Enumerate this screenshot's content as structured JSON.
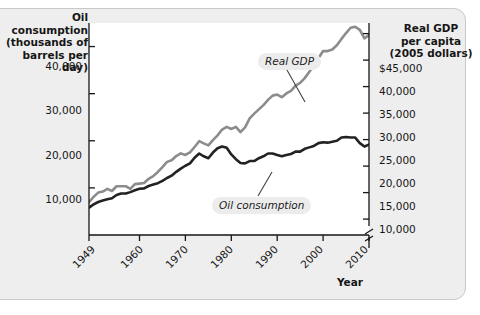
{
  "chart_data": {
    "type": "line",
    "title": "",
    "xlabel": "Year",
    "grid": false,
    "legend_position": "inline-callouts",
    "x": [
      1949,
      1950,
      1951,
      1952,
      1953,
      1954,
      1955,
      1956,
      1957,
      1958,
      1959,
      1960,
      1961,
      1962,
      1963,
      1964,
      1965,
      1966,
      1967,
      1968,
      1969,
      1970,
      1971,
      1972,
      1973,
      1974,
      1975,
      1976,
      1977,
      1978,
      1979,
      1980,
      1981,
      1982,
      1983,
      1984,
      1985,
      1986,
      1987,
      1988,
      1989,
      1990,
      1991,
      1992,
      1993,
      1994,
      1995,
      1996,
      1997,
      1998,
      1999,
      2000,
      2001,
      2002,
      2003,
      2004,
      2005,
      2006,
      2007,
      2008,
      2009,
      2010
    ],
    "xticks": [
      "1949",
      "1960",
      "1970",
      "1980",
      "1990",
      "2000",
      "2010"
    ],
    "xtick_values": [
      1949,
      1960,
      1970,
      1980,
      1990,
      2000,
      2010
    ],
    "axes": [
      {
        "id": "left",
        "label": "Oil consumption\n(thousands of\nbarrels per day)",
        "ticks": [
          "40,000",
          "30,000",
          "20,000",
          "10,000"
        ],
        "tick_values": [
          40000,
          30000,
          20000,
          10000
        ],
        "range": [
          0,
          45000
        ],
        "broken": false
      },
      {
        "id": "right",
        "label": "Real GDP\nper capita\n(2005 dollars)",
        "ticks": [
          "$45,000",
          "40,000",
          "35,000",
          "30,000",
          "25,000",
          "20,000",
          "15,000",
          "10,000"
        ],
        "tick_values": [
          45000,
          40000,
          35000,
          30000,
          25000,
          20000,
          15000,
          10000
        ],
        "range": [
          7000,
          47000
        ],
        "broken": true
      }
    ],
    "series": [
      {
        "name": "Real GDP",
        "axis": "right",
        "color": "#8c8c8c",
        "unit": "2005 dollars per capita",
        "values": [
          13200,
          14200,
          15000,
          15200,
          15700,
          15300,
          16200,
          16200,
          16200,
          15700,
          16600,
          16700,
          16800,
          17600,
          18100,
          18900,
          19800,
          20800,
          21100,
          21900,
          22400,
          22100,
          22600,
          23600,
          24700,
          24300,
          23900,
          24900,
          25800,
          26900,
          27400,
          27000,
          27400,
          26400,
          27300,
          29000,
          29900,
          30700,
          31500,
          32500,
          33300,
          33500,
          33000,
          33700,
          34200,
          35200,
          35700,
          36600,
          37800,
          39000,
          40400,
          41700,
          41700,
          42000,
          42800,
          44000,
          45100,
          46100,
          46300,
          45700,
          44100,
          44700
        ]
      },
      {
        "name": "Oil consumption",
        "axis": "left",
        "color": "#222222",
        "unit": "thousands of barrels per day",
        "values": [
          5800,
          6500,
          7000,
          7300,
          7600,
          7800,
          8500,
          8800,
          8800,
          9100,
          9500,
          9800,
          9900,
          10400,
          10700,
          11000,
          11500,
          12100,
          12600,
          13400,
          14100,
          14700,
          15200,
          16400,
          17300,
          16700,
          16300,
          17500,
          18400,
          18800,
          18500,
          17100,
          16100,
          15300,
          15200,
          15700,
          15700,
          16300,
          16700,
          17300,
          17300,
          17000,
          16700,
          17000,
          17200,
          17700,
          17700,
          18300,
          18600,
          18900,
          19500,
          19700,
          19600,
          19800,
          20000,
          20700,
          20800,
          20700,
          20680,
          19500,
          18770,
          19180
        ]
      }
    ],
    "annotations": [
      {
        "name": "real-gdp-callout",
        "text": "Real GDP"
      },
      {
        "name": "oil-consumption-callout",
        "text": "Oil consumption"
      }
    ]
  },
  "ytick_left": [
    "40,000",
    "30,000",
    "20,000",
    "10,000"
  ],
  "ytick_right": [
    "$45,000",
    "40,000",
    "35,000",
    "30,000",
    "25,000",
    "20,000",
    "15,000",
    "10,000"
  ],
  "xticks": [
    "1949",
    "1960",
    "1970",
    "1980",
    "1990",
    "2000",
    "2010"
  ],
  "titles": {
    "left_axis": "Oil consumption\n(thousands of\nbarrels per day)",
    "right_axis": "Real GDP\nper capita\n(2005 dollars)",
    "x_axis": "Year"
  },
  "labels": {
    "real_gdp": "Real GDP",
    "oil_consumption": "Oil consumption"
  },
  "colors": {
    "real_gdp_line": "#8c8c8c",
    "oil_line": "#222222",
    "panel_bg": "#ffffff",
    "figure_bg": "#eeeeee",
    "text": "#161616"
  }
}
